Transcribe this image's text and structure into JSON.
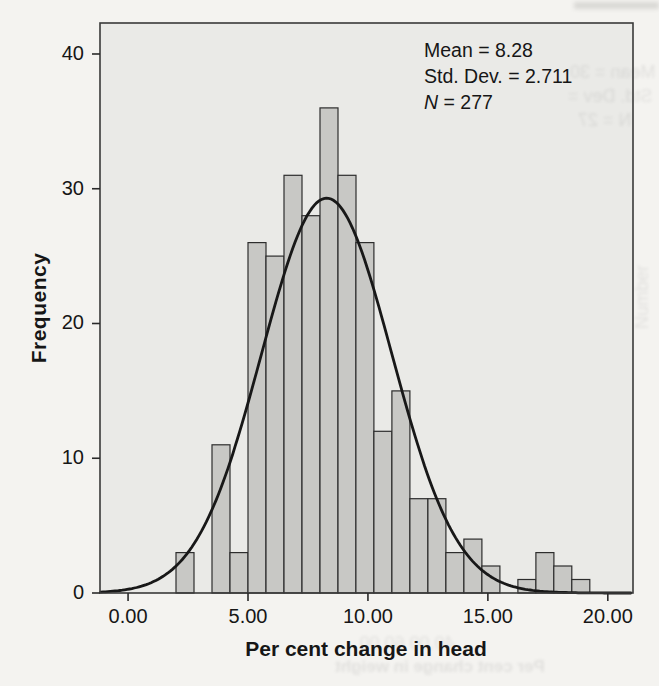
{
  "chart_data": {
    "type": "bar",
    "subtype": "histogram",
    "title": "",
    "xlabel": "Per cent change in head",
    "ylabel": "Frequency",
    "bin_start": 2.0,
    "bin_width": 0.75,
    "bin_edges": [
      2.0,
      2.75,
      3.5,
      4.25,
      5.0,
      5.75,
      6.5,
      7.25,
      8.0,
      8.75,
      9.5,
      10.25,
      11.0,
      11.75,
      12.5,
      13.25,
      14.0,
      14.75,
      15.5,
      16.25,
      17.0,
      17.75,
      18.5,
      19.25
    ],
    "counts": [
      3,
      0,
      11,
      3,
      26,
      25,
      31,
      28,
      36,
      31,
      26,
      12,
      15,
      7,
      7,
      3,
      4,
      2,
      0,
      1,
      3,
      2,
      1
    ],
    "counts_total": 277,
    "x_ticks": [
      {
        "v": 0,
        "label": "0.00"
      },
      {
        "v": 5,
        "label": "5.00"
      },
      {
        "v": 10,
        "label": "10.00"
      },
      {
        "v": 15,
        "label": "15.00"
      },
      {
        "v": 20,
        "label": "20.00"
      }
    ],
    "y_ticks": [
      {
        "v": 0,
        "label": "0"
      },
      {
        "v": 10,
        "label": "10"
      },
      {
        "v": 20,
        "label": "20"
      },
      {
        "v": 30,
        "label": "30"
      },
      {
        "v": 40,
        "label": "40"
      }
    ],
    "xlim": [
      -1.17,
      21.05
    ],
    "ylim": [
      0,
      42.3
    ],
    "grid": false,
    "legend": null,
    "normal_curve": {
      "mean": 8.28,
      "std_dev": 2.711,
      "n": 277,
      "peak_y": 29.3
    },
    "annotation": {
      "position": "top-right",
      "lines": [
        {
          "prefix": "",
          "prefix_italic": false,
          "text": "Mean = 8.28"
        },
        {
          "prefix": "",
          "prefix_italic": false,
          "text": "Std. Dev. = 2.711"
        },
        {
          "prefix": "N",
          "prefix_italic": true,
          "text": " = 277"
        }
      ]
    }
  },
  "colors": {
    "page_bg": "#f4f3f0",
    "plot_bg": "#eaeae7",
    "bar_fill": "#c8c8c5",
    "bar_stroke": "#2d2d2d",
    "frame": "#3a3a3a",
    "curve": "#181818",
    "tick": "#2a2a2a",
    "text": "#161616"
  },
  "bleedthrough": {
    "opacity": 0.12,
    "items": [
      {
        "area": "stats1",
        "text": "Mean = 30"
      },
      {
        "area": "stats2",
        "text": "Std. Dev ="
      },
      {
        "area": "stats3",
        "text": "N = 27"
      },
      {
        "area": "xticks",
        "text": "40.00     60.00"
      },
      {
        "area": "caption",
        "text": "Per cent change in weight"
      },
      {
        "area": "yvert",
        "text": "Number"
      }
    ]
  }
}
